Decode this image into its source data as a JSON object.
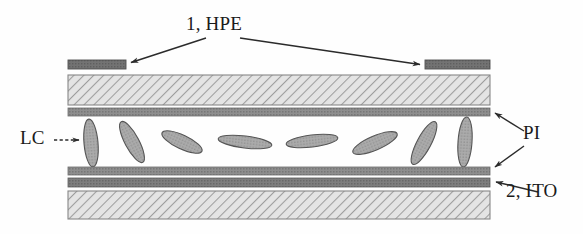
{
  "figure": {
    "width": 583,
    "height": 234,
    "background_color": "#fefefe"
  },
  "labels": {
    "hpe": "1, HPE",
    "lc": "LC",
    "pi": "PI",
    "ito": "2, ITO"
  },
  "colors": {
    "electrode_dark": "#6f6f6f",
    "electrode_edge": "#4a4a4a",
    "glass_fill": "#e2e2e2",
    "glass_hatch": "#9a9a9a",
    "glass_border": "#808080",
    "pi_band": "#8c8c8c",
    "ito_band": "#7a7a7a",
    "lc_fill": "#a8a8a8",
    "lc_edge": "#4f4f4f",
    "arrow": "#2b2b2b",
    "text": "#1a1a1a"
  },
  "layers": [
    {
      "name": "hpe-electrode-left",
      "type": "electrode",
      "x": 68,
      "y": 60,
      "width": 58,
      "height": 9,
      "label_ref": "hpe"
    },
    {
      "name": "hpe-electrode-right",
      "type": "electrode",
      "x": 425,
      "y": 60,
      "width": 65,
      "height": 9,
      "label_ref": "hpe"
    },
    {
      "name": "upper-glass-substrate",
      "type": "glass",
      "x": 68,
      "y": 75,
      "width": 422,
      "height": 30
    },
    {
      "name": "upper-pi-layer",
      "type": "pi",
      "x": 68,
      "y": 108,
      "width": 422,
      "height": 8,
      "label_ref": "pi"
    },
    {
      "name": "lower-pi-layer",
      "type": "pi",
      "x": 68,
      "y": 167,
      "width": 422,
      "height": 8,
      "label_ref": "pi"
    },
    {
      "name": "lower-ito-layer",
      "type": "ito",
      "x": 68,
      "y": 178,
      "width": 422,
      "height": 9,
      "label_ref": "ito"
    },
    {
      "name": "lower-glass-substrate",
      "type": "glass",
      "x": 68,
      "y": 191,
      "width": 422,
      "height": 28
    }
  ],
  "lc_molecules": [
    {
      "cx": 91,
      "cy": 143,
      "rx": 7,
      "ry": 24,
      "angle": -5
    },
    {
      "cx": 132,
      "cy": 142,
      "rx": 7,
      "ry": 23,
      "angle": -28
    },
    {
      "cx": 182,
      "cy": 142,
      "rx": 7,
      "ry": 22,
      "angle": -65
    },
    {
      "cx": 245,
      "cy": 142,
      "rx": 6,
      "ry": 27,
      "angle": -83
    },
    {
      "cx": 312,
      "cy": 141,
      "rx": 6,
      "ry": 26,
      "angle": -97
    },
    {
      "cx": 375,
      "cy": 143,
      "rx": 7,
      "ry": 24,
      "angle": -113
    },
    {
      "cx": 424,
      "cy": 143,
      "rx": 7,
      "ry": 24,
      "angle": -152
    },
    {
      "cx": 465,
      "cy": 142,
      "rx": 7,
      "ry": 25,
      "angle": -176
    }
  ],
  "annotations": [
    {
      "name": "hpe-arrow-left",
      "from": [
        206,
        38
      ],
      "to": [
        128,
        63
      ],
      "style": "solid",
      "label_ref": "hpe"
    },
    {
      "name": "hpe-arrow-right",
      "from": [
        240,
        38
      ],
      "to": [
        423,
        65
      ],
      "style": "solid",
      "label_ref": "hpe"
    },
    {
      "name": "lc-arrow",
      "from": [
        56,
        140
      ],
      "to": [
        80,
        140
      ],
      "style": "dashed",
      "label_ref": "lc"
    },
    {
      "name": "pi-arrow-upper",
      "from": [
        523,
        130
      ],
      "to": [
        494,
        113
      ],
      "style": "solid",
      "label_ref": "pi"
    },
    {
      "name": "pi-arrow-lower",
      "from": [
        523,
        145
      ],
      "to": [
        494,
        168
      ],
      "style": "solid",
      "label_ref": "pi"
    },
    {
      "name": "ito-arrow",
      "from": [
        536,
        192
      ],
      "to": [
        494,
        182
      ],
      "style": "solid",
      "label_ref": "ito"
    }
  ]
}
